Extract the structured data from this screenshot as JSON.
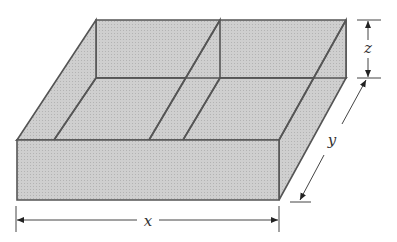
{
  "figure": {
    "fill_color": "#c9c9c9",
    "edge_color": "#555555",
    "dimension_color": "#444444"
  },
  "labels": {
    "x": "x",
    "y": "y",
    "z": "z"
  }
}
